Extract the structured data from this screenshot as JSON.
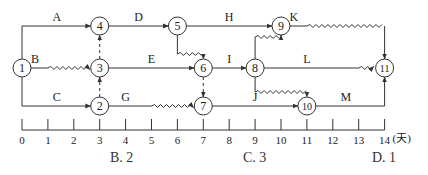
{
  "diagram": {
    "type": "time-scaled network diagram (double-code, dates on time axis)",
    "unit_label": "(天)",
    "axis_ticks": [
      "0",
      "1",
      "2",
      "3",
      "4",
      "5",
      "6",
      "7",
      "8",
      "9",
      "10",
      "11",
      "12",
      "13",
      "14"
    ],
    "nodes": [
      {
        "id": "1",
        "label": "1",
        "day": 0,
        "row": "middle"
      },
      {
        "id": "2",
        "label": "2",
        "day": 3,
        "row": "bottom"
      },
      {
        "id": "3",
        "label": "3",
        "day": 3,
        "row": "middle"
      },
      {
        "id": "4",
        "label": "4",
        "day": 3,
        "row": "top"
      },
      {
        "id": "5",
        "label": "5",
        "day": 6,
        "row": "top"
      },
      {
        "id": "6",
        "label": "6",
        "day": 7,
        "row": "middle"
      },
      {
        "id": "7",
        "label": "7",
        "day": 7,
        "row": "bottom"
      },
      {
        "id": "8",
        "label": "8",
        "day": 9,
        "row": "middle"
      },
      {
        "id": "9",
        "label": "9",
        "day": 10,
        "row": "top"
      },
      {
        "id": "10",
        "label": "10",
        "day": 11,
        "row": "bottom"
      },
      {
        "id": "11",
        "label": "11",
        "day": 14,
        "row": "middle"
      }
    ],
    "activities": [
      {
        "name": "A",
        "from": "1",
        "to": "4",
        "duration": 3,
        "free_float": 0
      },
      {
        "name": "B",
        "from": "1",
        "to": "3",
        "duration": 1,
        "free_float": 2
      },
      {
        "name": "C",
        "from": "1",
        "to": "2",
        "duration": 3,
        "free_float": 0
      },
      {
        "name": "D",
        "from": "4",
        "to": "5",
        "duration": 3,
        "free_float": 0
      },
      {
        "name": "E",
        "from": "3",
        "to": "6",
        "duration": 4,
        "free_float": 0
      },
      {
        "name": "G",
        "from": "2",
        "to": "7",
        "duration": 2,
        "free_float": 2
      },
      {
        "name": "H",
        "from": "5",
        "to": "9",
        "duration": 4,
        "free_float": 0
      },
      {
        "name": "I",
        "from": "6",
        "to": "8",
        "duration": 2,
        "free_float": 0
      },
      {
        "name": "J",
        "from": "7",
        "to": "10",
        "duration": 4,
        "free_float": 0
      },
      {
        "name": "K",
        "from": "9",
        "to": "11",
        "duration": 1,
        "free_float": 3
      },
      {
        "name": "L",
        "from": "8",
        "to": "11",
        "duration": 4,
        "free_float": 1
      },
      {
        "name": "M",
        "from": "10",
        "to": "11",
        "duration": 3,
        "free_float": 0
      }
    ],
    "dummies": [
      {
        "from": "3",
        "to": "4"
      },
      {
        "from": "2",
        "to": "3"
      },
      {
        "from": "5",
        "to": "6",
        "free_float": 1
      },
      {
        "from": "6",
        "to": "7"
      },
      {
        "from": "8",
        "to": "9",
        "free_float": 1
      },
      {
        "from": "8",
        "to": "10",
        "free_float": 2
      }
    ]
  },
  "answer_options": [
    {
      "key": "B",
      "text": "B. 2"
    },
    {
      "key": "C",
      "text": "C. 3"
    },
    {
      "key": "D",
      "text": "D. 1"
    }
  ],
  "colors": {
    "line": "#333333",
    "text": "#222222",
    "background": "#ffffff"
  }
}
